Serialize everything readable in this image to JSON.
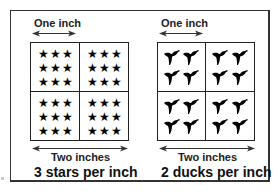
{
  "left_panel": {
    "top_label": "One inch",
    "bottom_label": "Two inches",
    "caption": "3 stars per inch",
    "icon": "star-icon",
    "icons_per_cell": 9,
    "cells": 4
  },
  "right_panel": {
    "top_label": "One inch",
    "bottom_label": "Two inches",
    "caption": "2 ducks per inch",
    "icon": "duck-icon",
    "icons_per_cell": 4,
    "cells": 4
  },
  "colors": {
    "line": "#222222",
    "icon": "#000000",
    "background": "#ffffff"
  },
  "glyphs": {
    "star": "★"
  }
}
